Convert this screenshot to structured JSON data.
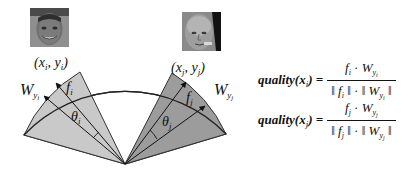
{
  "diagram": {
    "apex": [
      125,
      164
    ],
    "arc": {
      "left_end": [
        24,
        135
      ],
      "right_end": [
        226,
        134
      ],
      "top_y": 53
    },
    "colors": {
      "left_sector": "#c8c8c8",
      "right_sector": "#9a9a9a",
      "center": "#ffffff",
      "stroke": "#222222"
    },
    "labels": {
      "xi_yi": "(x",
      "xi_sub": "i",
      "yi_mid": ", y",
      "yi_sub": "i",
      "close": ")",
      "xj_sub": "j",
      "yj_sub": "j",
      "W": "W",
      "y": "y",
      "f": "f",
      "theta": "θ",
      "i": "i",
      "j": "j"
    }
  },
  "faces": [
    {
      "name": "face-i",
      "desc": "smiling man portrait (grayscale)"
    },
    {
      "name": "face-j",
      "desc": "bald man portrait (grayscale)"
    }
  ],
  "formulas": [
    {
      "lhs": "quality(x",
      "lhs_sub": "i",
      "lhs_close": ") =",
      "num_f": "f",
      "num_f_sub": "i",
      "dot": " · ",
      "num_W": "W",
      "num_y": "y",
      "num_y_sub": "i",
      "den_open": "‖ ",
      "den_close": " ‖",
      "den_mid": " · "
    },
    {
      "lhs": "quality(x",
      "lhs_sub": "j",
      "lhs_close": ") =",
      "num_f": "f",
      "num_f_sub": "j",
      "dot": " · ",
      "num_W": "W",
      "num_y": "y",
      "num_y_sub": "j",
      "den_open": "‖ ",
      "den_close": " ‖",
      "den_mid": " · "
    }
  ]
}
